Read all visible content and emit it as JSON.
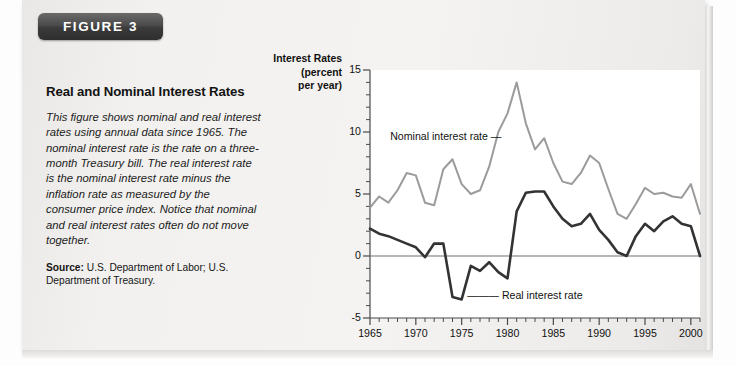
{
  "figure": {
    "badge_label": "FIGURE 3",
    "title": "Real and Nominal Interest Rates",
    "description": "This figure shows nominal and real interest rates using annual data since 1965. The nominal interest rate is the rate on a three-month Treasury bill. The real interest rate is the nominal interest rate minus the inflation rate as measured by the consumer price index. Notice that nominal and real interest rates often do not move together.",
    "source_prefix": "Source:",
    "source_text": " U.S. Department of Labor; U.S. Department of Treasury."
  },
  "chart_data": {
    "type": "line",
    "title": "",
    "axis_title_lines": [
      "Interest Rates",
      "(percent",
      "per year)"
    ],
    "ylabel": "Interest Rates (percent per year)",
    "xlabel": "",
    "ylim": [
      -5,
      15
    ],
    "xlim": [
      1965,
      2001
    ],
    "ytick_labels": [
      "15",
      "10",
      "5",
      "0",
      "-5"
    ],
    "yticks": [
      15,
      10,
      5,
      0,
      -5
    ],
    "yminor_step": 1,
    "xtick_labels": [
      "1965",
      "1970",
      "1975",
      "1980",
      "1985",
      "1990",
      "1995",
      "2000"
    ],
    "xticks": [
      1965,
      1970,
      1975,
      1980,
      1985,
      1990,
      1995,
      2000
    ],
    "xminor_step": 1,
    "grid": false,
    "zero_line": 0,
    "legend_position": "inline-annotations",
    "annotations": [
      {
        "text": "Nominal interest rate",
        "pointer": "—",
        "series": "nominal"
      },
      {
        "text": "Real interest rate",
        "pointer": "—",
        "series": "real"
      }
    ],
    "colors": {
      "nominal": "#9b9b9b",
      "real": "#333333",
      "axis": "#4a4a4a",
      "zero_line": "#6e6e6e"
    },
    "x": [
      1965,
      1966,
      1967,
      1968,
      1969,
      1970,
      1971,
      1972,
      1973,
      1974,
      1975,
      1976,
      1977,
      1978,
      1979,
      1980,
      1981,
      1982,
      1983,
      1984,
      1985,
      1986,
      1987,
      1988,
      1989,
      1990,
      1991,
      1992,
      1993,
      1994,
      1995,
      1996,
      1997,
      1998,
      1999,
      2000,
      2001
    ],
    "series": [
      {
        "name": "Nominal interest rate",
        "key": "nominal",
        "color": "#9b9b9b",
        "values": [
          3.9,
          4.8,
          4.3,
          5.3,
          6.7,
          6.5,
          4.3,
          4.1,
          7.0,
          7.8,
          5.8,
          5.0,
          5.3,
          7.2,
          10.0,
          11.5,
          14.0,
          10.7,
          8.6,
          9.5,
          7.5,
          6.0,
          5.8,
          6.7,
          8.1,
          7.5,
          5.4,
          3.4,
          3.0,
          4.2,
          5.5,
          5.0,
          5.1,
          4.8,
          4.7,
          5.8,
          3.4
        ]
      },
      {
        "name": "Real interest rate",
        "key": "real",
        "color": "#333333",
        "values": [
          2.2,
          1.8,
          1.6,
          1.3,
          1.0,
          0.7,
          -0.1,
          1.0,
          1.0,
          -3.3,
          -3.5,
          -0.8,
          -1.2,
          -0.5,
          -1.3,
          -1.8,
          3.6,
          5.1,
          5.2,
          5.2,
          4.0,
          3.0,
          2.4,
          2.6,
          3.4,
          2.1,
          1.3,
          0.3,
          0.0,
          1.6,
          2.6,
          2.0,
          2.8,
          3.2,
          2.6,
          2.4,
          0.0
        ]
      }
    ]
  }
}
